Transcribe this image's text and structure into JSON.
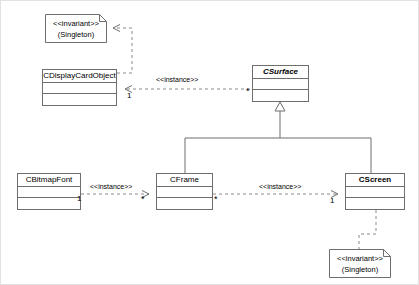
{
  "diagram": {
    "type": "uml-class-diagram",
    "stroke_color": "#6e6e6e",
    "background_color": "#ffffff"
  },
  "classes": [
    {
      "id": "cdisplaycardobject",
      "name": "CDisplayCardObject",
      "abstract": false,
      "x": 41,
      "y": 68,
      "w": 75,
      "h": 37
    },
    {
      "id": "csurface",
      "name": "CSurface",
      "abstract": true,
      "x": 251,
      "y": 64,
      "w": 57,
      "h": 37
    },
    {
      "id": "cbitmapfont",
      "name": "CBitmapFont",
      "abstract": false,
      "x": 16,
      "y": 172,
      "w": 64,
      "h": 37
    },
    {
      "id": "cframe",
      "name": "CFrame",
      "abstract": false,
      "x": 155,
      "y": 172,
      "w": 57,
      "h": 37
    },
    {
      "id": "cscreen",
      "name": "CScreen",
      "abstract": false,
      "x": 344,
      "y": 172,
      "w": 60,
      "h": 37
    }
  ],
  "notes": [
    {
      "id": "note-display-singleton",
      "line1": "<<invariant>>",
      "line2": "(Singleton)",
      "x": 44,
      "y": 13,
      "w": 62,
      "h": 29,
      "attached_to": "cdisplaycardobject"
    },
    {
      "id": "note-screen-singleton",
      "line1": "<<invariant>>",
      "line2": "(Singleton)",
      "x": 328,
      "y": 248,
      "w": 62,
      "h": 29,
      "attached_to": "cscreen"
    }
  ],
  "relations": [
    {
      "id": "rel-display-surface",
      "from": "csurface",
      "to": "cdisplaycardobject",
      "kind": "dependency",
      "stereotype": "<<instance>>",
      "label_x": 155,
      "label_y": 75,
      "source_multiplicity": "*",
      "target_multiplicity": "1"
    },
    {
      "id": "rel-bitmapfont-frame",
      "from": "cbitmapfont",
      "to": "cframe",
      "kind": "dependency",
      "stereotype": "<<instance>>",
      "label_x": 89,
      "label_y": 182,
      "source_multiplicity": "1",
      "target_multiplicity": "*"
    },
    {
      "id": "rel-frame-screen",
      "from": "cframe",
      "to": "cscreen",
      "kind": "dependency",
      "stereotype": "<<instance>>",
      "label_x": 258,
      "label_y": 182,
      "source_multiplicity": "*",
      "target_multiplicity": "1"
    },
    {
      "id": "rel-generalization",
      "from": [
        "cframe",
        "cscreen"
      ],
      "to": "csurface",
      "kind": "generalization",
      "stereotype": "",
      "source_multiplicity": "",
      "target_multiplicity": ""
    }
  ]
}
